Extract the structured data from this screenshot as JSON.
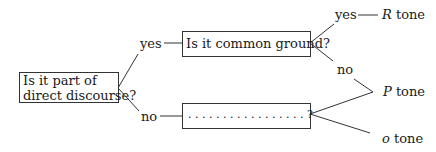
{
  "diagram": {
    "root": {
      "line1": "Is it part of",
      "line2": "direct discourse?"
    },
    "branches": {
      "yes_label": "yes",
      "no_label": "no"
    },
    "node_common_ground": {
      "label": "Is it common ground?",
      "yes_label": "yes",
      "no_label": "no"
    },
    "node_unknown": {
      "label": ". . . . . . . . . . . . . . . . . ?"
    },
    "outcomes": {
      "r_tone": {
        "letter": "R",
        "suffix": " tone"
      },
      "p_tone": {
        "letter": "P",
        "suffix": " tone"
      },
      "o_tone": {
        "letter": "o",
        "suffix": " tone"
      }
    }
  }
}
